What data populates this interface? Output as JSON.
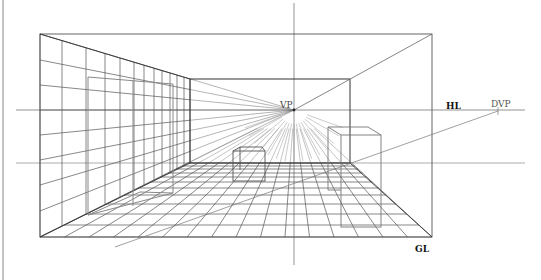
{
  "diagram": {
    "labels": {
      "vp": "VP",
      "hl": "HL",
      "dvp": "DVP",
      "gl": "GL"
    },
    "colors": {
      "line": "#555555",
      "line_dark": "#222222",
      "line_light": "#999999",
      "background": "#ffffff"
    },
    "geometry": {
      "vanishing_point": [
        294,
        110
      ],
      "diagonal_vanishing_point": [
        498,
        111
      ],
      "horizon_y": 110,
      "ground_line_y": 237,
      "outer_frame": {
        "x1": 40,
        "y1": 34,
        "x2": 432,
        "y2": 237
      },
      "back_wall": {
        "x1": 190,
        "y1": 79,
        "x2": 350,
        "y2": 163
      }
    },
    "elements": [
      "horizon-line",
      "ground-line",
      "vanishing-point",
      "diagonal-vanishing-point",
      "floor-grid",
      "left-wall-grid",
      "back-wall",
      "box-left-wall",
      "box-center-floor",
      "box-right-floor"
    ]
  }
}
